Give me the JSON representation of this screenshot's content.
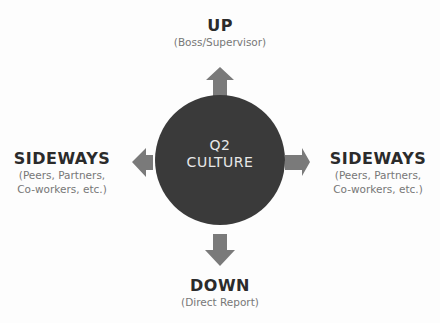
{
  "center": {
    "line1": "Q2",
    "line2": "CULTURE",
    "color": "#3a3a3a"
  },
  "arrow_color": "#7a7a7a",
  "up": {
    "title": "UP",
    "subtitle": "(Boss/Supervisor)"
  },
  "down": {
    "title": "DOWN",
    "subtitle": "(Direct Report)"
  },
  "left": {
    "title": "SIDEWAYS",
    "subtitle_line1": "(Peers, Partners,",
    "subtitle_line2": "Co-workers, etc.)"
  },
  "right": {
    "title": "SIDEWAYS",
    "subtitle_line1": "(Peers, Partners,",
    "subtitle_line2": "Co-workers, etc.)"
  }
}
